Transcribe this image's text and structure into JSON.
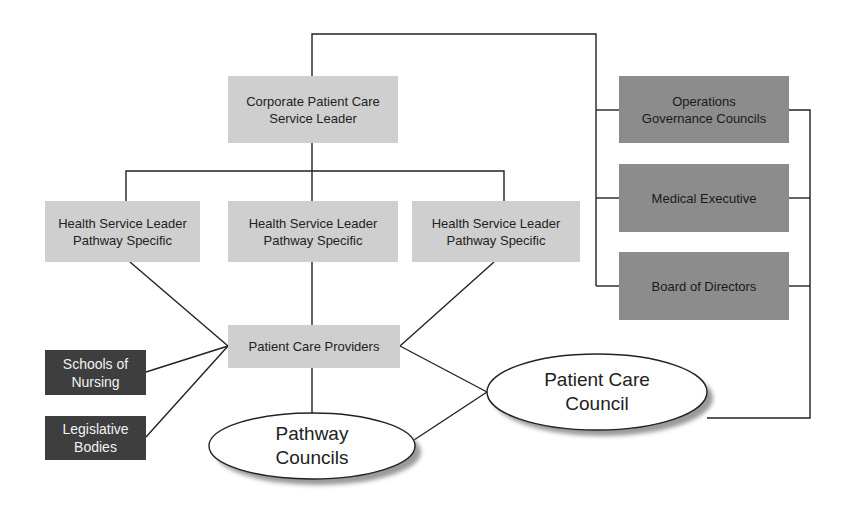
{
  "diagram": {
    "type": "organizational-structure",
    "colors": {
      "light_box": "#cfcfcf",
      "mid_box": "#8c8c8c",
      "dark_box": "#3e3e3e",
      "line": "#222222",
      "ellipse_fill": "#ffffff",
      "ellipse_shadow": "#9a9a9a"
    },
    "nodes": {
      "corporate_leader": "Corporate Patient Care\nService Leader",
      "health_leader_1": "Health Service Leader\nPathway Specific",
      "health_leader_2": "Health Service Leader\nPathway Specific",
      "health_leader_3": "Health Service Leader\nPathway Specific",
      "operations_councils": "Operations\nGovernance Councils",
      "medical_executive": "Medical Executive",
      "board_of_directors": "Board of Directors",
      "patient_care_providers": "Patient Care Providers",
      "schools_of_nursing": "Schools of\nNursing",
      "legislative_bodies": "Legislative\nBodies",
      "pathway_councils": "Pathway\nCouncils",
      "patient_care_council": "Patient Care\nCouncil"
    },
    "edges": [
      [
        "corporate_leader",
        "operations_councils"
      ],
      [
        "corporate_leader",
        "medical_executive"
      ],
      [
        "corporate_leader",
        "board_of_directors"
      ],
      [
        "corporate_leader",
        "health_leader_1"
      ],
      [
        "corporate_leader",
        "health_leader_2"
      ],
      [
        "corporate_leader",
        "health_leader_3"
      ],
      [
        "health_leader_1",
        "patient_care_providers"
      ],
      [
        "health_leader_2",
        "patient_care_providers"
      ],
      [
        "health_leader_3",
        "patient_care_providers"
      ],
      [
        "schools_of_nursing",
        "patient_care_providers"
      ],
      [
        "legislative_bodies",
        "patient_care_providers"
      ],
      [
        "patient_care_providers",
        "pathway_councils"
      ],
      [
        "patient_care_providers",
        "patient_care_council"
      ],
      [
        "pathway_councils",
        "patient_care_council"
      ],
      [
        "operations_councils",
        "patient_care_council"
      ],
      [
        "medical_executive",
        "patient_care_council"
      ],
      [
        "board_of_directors",
        "patient_care_council"
      ]
    ]
  }
}
